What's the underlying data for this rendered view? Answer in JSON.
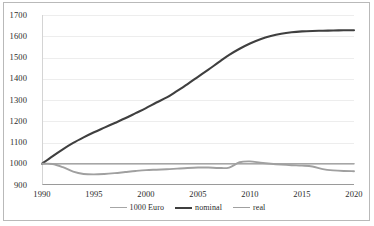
{
  "chart_data": {
    "type": "line",
    "title": "",
    "xlabel": "",
    "ylabel": "",
    "xlim": [
      1990,
      2020
    ],
    "ylim": [
      900,
      1700
    ],
    "ytick_step": 100,
    "grid": true,
    "legend_position": "bottom-center",
    "y_ticks": [
      "1700",
      "1600",
      "1500",
      "1400",
      "1300",
      "1200",
      "1100",
      "1000",
      "900"
    ],
    "y_tick_values": [
      1700,
      1600,
      1500,
      1400,
      1300,
      1200,
      1100,
      1000,
      900
    ],
    "x_ticks": [
      "1990",
      "1995",
      "2000",
      "2005",
      "2010",
      "2015",
      "2020"
    ],
    "x_tick_values": [
      1990,
      1995,
      2000,
      2005,
      2010,
      2015,
      2020
    ],
    "x": [
      1990,
      1991,
      1992,
      1993,
      1994,
      1995,
      1996,
      1997,
      1998,
      1999,
      2000,
      2001,
      2002,
      2003,
      2004,
      2005,
      2006,
      2007,
      2008,
      2009,
      2010,
      2011,
      2012,
      2013,
      2014,
      2015,
      2016,
      2017,
      2018,
      2019,
      2020
    ],
    "series": [
      {
        "name": "1000 Euro",
        "color": "#a6a6a6",
        "width": 1.6,
        "values": [
          1000,
          1000,
          1000,
          1000,
          1000,
          1000,
          1000,
          1000,
          1000,
          1000,
          1000,
          1000,
          1000,
          1000,
          1000,
          1000,
          1000,
          1000,
          1000,
          1000,
          1000,
          1000,
          1000,
          1000,
          1000,
          1000,
          1000,
          1000,
          1000,
          1000,
          1000
        ]
      },
      {
        "name": "nominal",
        "color": "#3f3f3f",
        "width": 2.1,
        "values": [
          1000,
          1035,
          1068,
          1098,
          1124,
          1148,
          1170,
          1192,
          1214,
          1238,
          1262,
          1288,
          1312,
          1343,
          1375,
          1409,
          1443,
          1478,
          1512,
          1541,
          1566,
          1586,
          1601,
          1612,
          1619,
          1623,
          1625,
          1626,
          1627,
          1628,
          1628
        ]
      },
      {
        "name": "real",
        "color": "#a0a0a0",
        "width": 1.9,
        "values": [
          1000,
          999,
          984,
          963,
          952,
          950,
          952,
          956,
          961,
          966,
          970,
          972,
          974,
          977,
          980,
          982,
          982,
          980,
          982,
          1007,
          1011,
          1005,
          1000,
          996,
          993,
          991,
          987,
          975,
          969,
          966,
          965
        ]
      }
    ]
  },
  "legend": {
    "entries": [
      {
        "label": "1000 Euro"
      },
      {
        "label": "nominal"
      },
      {
        "label": "real"
      }
    ]
  }
}
